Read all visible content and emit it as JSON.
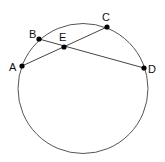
{
  "diagram": {
    "type": "circle-geometry",
    "circle": {
      "cx": 83,
      "cy": 88.5,
      "r": 65,
      "stroke": "#555555"
    },
    "points": [
      {
        "id": "A",
        "label": "A",
        "x": 22,
        "y": 66,
        "lx": 9,
        "ly": 71
      },
      {
        "id": "B",
        "label": "B",
        "x": 39,
        "y": 39,
        "lx": 29,
        "ly": 38
      },
      {
        "id": "C",
        "label": "C",
        "x": 107,
        "y": 27,
        "lx": 102,
        "ly": 21
      },
      {
        "id": "D",
        "label": "D",
        "x": 144,
        "y": 68,
        "lx": 148,
        "ly": 73
      },
      {
        "id": "E",
        "label": "E",
        "x": 64,
        "y": 47,
        "lx": 59,
        "ly": 41
      }
    ],
    "segments": [
      {
        "from": "A",
        "to": "C"
      },
      {
        "from": "B",
        "to": "D"
      }
    ],
    "intersection": {
      "point": "E",
      "of": [
        "AC",
        "BD"
      ]
    },
    "colors": {
      "line": "#444444",
      "point": "#000000",
      "text": "#111111"
    }
  }
}
